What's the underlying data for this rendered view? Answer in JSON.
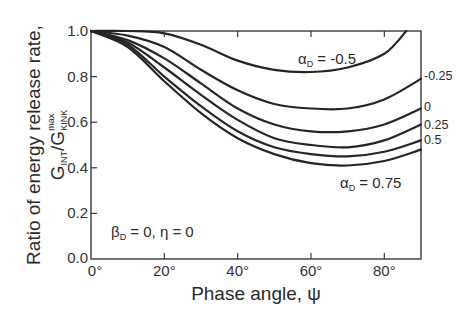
{
  "chart_data": {
    "type": "line",
    "title": "",
    "xlabel": "Phase angle, ψ",
    "ylabel_line1": "Ratio of energy release rate,",
    "ylabel_line2_parts": {
      "g1": "G",
      "sub1": "INT",
      "slash": "/",
      "g2": "G",
      "sub2": "KINK",
      "sup2": "max"
    },
    "xlim": [
      0,
      90
    ],
    "ylim": [
      0.0,
      1.0
    ],
    "xticks": [
      0,
      20,
      40,
      60,
      80
    ],
    "xtick_labels": [
      "0°",
      "20°",
      "40°",
      "60°",
      "80°"
    ],
    "yticks": [
      0.0,
      0.2,
      0.4,
      0.6,
      0.8,
      1.0
    ],
    "ytick_labels": [
      "0.0",
      "0.2",
      "0.4",
      "0.6",
      "0.8",
      "1.0"
    ],
    "grid": false,
    "legend": "inline labels at curve ends",
    "x": [
      0,
      10,
      20,
      30,
      40,
      50,
      60,
      70,
      80,
      90
    ],
    "series": [
      {
        "name": "αD = -0.5",
        "label": "-0.5",
        "x": [
          0,
          10,
          20,
          30,
          40,
          50,
          60,
          70,
          80,
          86
        ],
        "values": [
          1.0,
          1.0,
          0.99,
          0.94,
          0.87,
          0.83,
          0.82,
          0.84,
          0.9,
          1.0
        ]
      },
      {
        "name": "αD = -0.25",
        "label": "-0.25",
        "x": [
          0,
          10,
          20,
          30,
          40,
          50,
          60,
          70,
          80,
          90
        ],
        "values": [
          1.0,
          0.98,
          0.93,
          0.83,
          0.74,
          0.68,
          0.66,
          0.66,
          0.7,
          0.79
        ]
      },
      {
        "name": "αD = 0",
        "label": "0",
        "x": [
          0,
          10,
          20,
          30,
          40,
          50,
          60,
          70,
          80,
          90
        ],
        "values": [
          1.0,
          0.96,
          0.88,
          0.77,
          0.66,
          0.59,
          0.56,
          0.56,
          0.59,
          0.66
        ]
      },
      {
        "name": "αD = 0.25",
        "label": "0.25",
        "x": [
          0,
          10,
          20,
          30,
          40,
          50,
          60,
          70,
          80,
          90
        ],
        "values": [
          1.0,
          0.95,
          0.84,
          0.72,
          0.61,
          0.53,
          0.5,
          0.49,
          0.52,
          0.59
        ]
      },
      {
        "name": "αD = 0.5",
        "label": "0.5",
        "x": [
          0,
          10,
          20,
          30,
          40,
          50,
          60,
          70,
          80,
          90
        ],
        "values": [
          1.0,
          0.94,
          0.8,
          0.67,
          0.56,
          0.49,
          0.46,
          0.45,
          0.47,
          0.52
        ]
      },
      {
        "name": "αD = 0.75",
        "label": "0.75",
        "x": [
          0,
          10,
          20,
          30,
          40,
          50,
          60,
          70,
          80,
          90
        ],
        "values": [
          1.0,
          0.93,
          0.78,
          0.64,
          0.53,
          0.46,
          0.42,
          0.41,
          0.43,
          0.48
        ]
      }
    ],
    "annotations": {
      "alpha_top": {
        "sym": "α",
        "sub": "D",
        "text": " = -0.5"
      },
      "alpha_bottom": {
        "sym": "α",
        "sub": "D",
        "text": " = 0.75"
      },
      "right_labels": [
        "-0.25",
        "0",
        "0.25",
        "0.5"
      ],
      "params": {
        "sym": "β",
        "sub": "D",
        "text": " = 0, η = 0"
      }
    },
    "colors": {
      "line": "#262626",
      "axis": "#3a3a3a",
      "text": "#2a2a2a"
    }
  }
}
